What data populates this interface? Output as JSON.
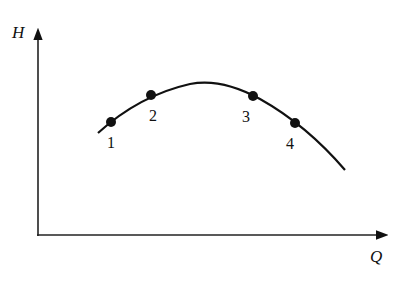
{
  "figure": {
    "y_axis_label": "H",
    "x_axis_label": "Q",
    "curve": {
      "description": "pump characteristic H-Q curve, concave down",
      "path_points": [
        [
          98,
          133
        ],
        [
          111,
          122
        ],
        [
          151,
          95
        ],
        [
          205,
          82
        ],
        [
          253,
          96
        ],
        [
          295,
          123
        ],
        [
          345,
          170
        ]
      ]
    },
    "points": [
      {
        "label": "1",
        "x": 111,
        "y": 122,
        "label_x": 111,
        "label_y": 148
      },
      {
        "label": "2",
        "x": 151,
        "y": 95,
        "label_x": 153,
        "label_y": 121
      },
      {
        "label": "3",
        "x": 253,
        "y": 96,
        "label_x": 246,
        "label_y": 122
      },
      {
        "label": "4",
        "x": 295,
        "y": 123,
        "label_x": 290,
        "label_y": 149
      }
    ],
    "colors": {
      "line": "#111111",
      "background": "#ffffff"
    }
  }
}
